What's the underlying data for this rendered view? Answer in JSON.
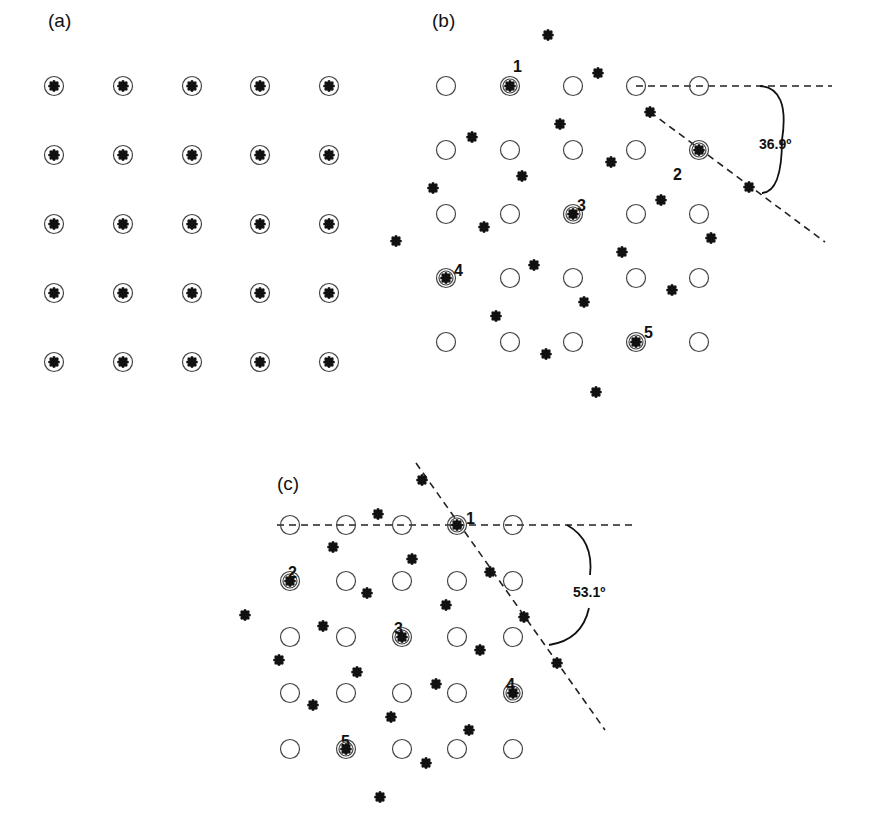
{
  "figure": {
    "panels": [
      {
        "id": "a",
        "label": "(a)",
        "label_pos": [
          48,
          20
        ],
        "lattice": {
          "cols": [
            54,
            123,
            192,
            260,
            329
          ],
          "rows": [
            86,
            155,
            224,
            293,
            362
          ]
        },
        "all_coincident": true
      },
      {
        "id": "b",
        "label": "(b)",
        "label_pos": [
          432,
          20
        ],
        "lattice": {
          "cols": [
            446,
            510,
            573,
            636,
            699
          ],
          "rows": [
            86,
            150,
            214,
            278,
            342
          ]
        },
        "coincidence_labels": [
          {
            "text": "1",
            "x": 517,
            "y": 66
          },
          {
            "text": "2",
            "x": 677,
            "y": 174
          },
          {
            "text": "3",
            "x": 581,
            "y": 205
          },
          {
            "text": "4",
            "x": 458,
            "y": 270
          },
          {
            "text": "5",
            "x": 648,
            "y": 332
          }
        ],
        "coincidence_sites": [
          [
            510,
            86
          ],
          [
            699,
            150
          ],
          [
            573,
            214
          ],
          [
            446,
            278
          ],
          [
            636,
            342
          ]
        ],
        "rotated_atoms": [
          [
            548,
            35
          ],
          [
            598,
            73
          ],
          [
            650,
            112
          ],
          [
            560,
            124
          ],
          [
            472,
            137
          ],
          [
            522,
            176
          ],
          [
            611,
            162
          ],
          [
            433,
            188
          ],
          [
            484,
            227
          ],
          [
            396,
            241
          ],
          [
            661,
            200
          ],
          [
            749,
            187
          ],
          [
            711,
            238
          ],
          [
            622,
            252
          ],
          [
            534,
            265
          ],
          [
            672,
            290
          ],
          [
            584,
            302
          ],
          [
            496,
            316
          ],
          [
            546,
            354
          ],
          [
            596,
            392
          ]
        ],
        "angle_label": "36.9º",
        "angle_label_pos": [
          759,
          144
        ],
        "lines": [
          {
            "x1": 636,
            "y1": 86,
            "x2": 832,
            "y2": 86
          },
          {
            "x1": 650,
            "y1": 112,
            "x2": 825,
            "y2": 242
          }
        ],
        "arc": "M 760 86 Q 790 88 782 140 Q 782 192 762 193"
      },
      {
        "id": "c",
        "label": "(c)",
        "label_pos": [
          277,
          483
        ],
        "lattice": {
          "cols": [
            290,
            346,
            402,
            457,
            513
          ],
          "rows": [
            525,
            581,
            637,
            693,
            749
          ]
        },
        "coincidence_labels": [
          {
            "text": "1",
            "x": 470,
            "y": 518
          },
          {
            "text": "2",
            "x": 292,
            "y": 572
          },
          {
            "text": "3",
            "x": 398,
            "y": 628
          },
          {
            "text": "4",
            "x": 510,
            "y": 684
          },
          {
            "text": "5",
            "x": 345,
            "y": 741
          }
        ],
        "coincidence_sites": [
          [
            457,
            525
          ],
          [
            290,
            581
          ],
          [
            402,
            637
          ],
          [
            513,
            693
          ],
          [
            346,
            749
          ]
        ],
        "rotated_atoms": [
          [
            422,
            480
          ],
          [
            378,
            514
          ],
          [
            333,
            547
          ],
          [
            412,
            559
          ],
          [
            490,
            572
          ],
          [
            367,
            593
          ],
          [
            446,
            605
          ],
          [
            524,
            617
          ],
          [
            245,
            615
          ],
          [
            323,
            626
          ],
          [
            480,
            650
          ],
          [
            557,
            663
          ],
          [
            279,
            660
          ],
          [
            357,
            672
          ],
          [
            436,
            684
          ],
          [
            313,
            705
          ],
          [
            391,
            717
          ],
          [
            469,
            730
          ],
          [
            426,
            763
          ],
          [
            380,
            797
          ]
        ],
        "angle_label": "53.1º",
        "angle_label_pos": [
          573,
          592
        ],
        "lines": [
          {
            "x1": 277,
            "y1": 525,
            "x2": 637,
            "y2": 525
          },
          {
            "x1": 416,
            "y1": 463,
            "x2": 605,
            "y2": 730
          }
        ],
        "arc": "M 567 525 Q 594 540 590 575 M 589 608 Q 582 640 549 645"
      }
    ]
  }
}
